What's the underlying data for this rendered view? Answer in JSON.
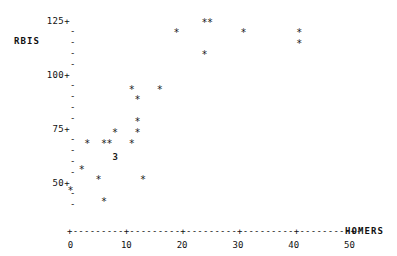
{
  "header": {
    "clipped_row": "THE    TOP   RBIS    AND   HOMERS"
  },
  "axes": {
    "ylabel": "RBIS",
    "xlabel": "HOMERS",
    "y_ticks": [
      "125+",
      "100+",
      "75+",
      "50+"
    ],
    "y_tick_values": [
      125,
      100,
      75,
      50
    ],
    "x_ticks": [
      "0",
      "10",
      "20",
      "30",
      "40",
      "50"
    ],
    "x_tick_values": [
      0,
      10,
      20,
      30,
      40,
      50
    ],
    "x_axis_glyph": "+---------+---------+---------+---------+---------+-",
    "minor_tick_glyph": "-",
    "marker_glyph": "*"
  },
  "chart_data": {
    "type": "scatter",
    "title": "",
    "xlabel": "HOMERS",
    "ylabel": "RBIS",
    "xlim": [
      0,
      52
    ],
    "ylim": [
      38,
      128
    ],
    "grid": false,
    "legend": null,
    "marker": "*",
    "note": "Character-cell scatter plot; the digit '3' marks a cell containing 3 coincident points.",
    "points": [
      {
        "x": 24,
        "y": 124,
        "label": "*"
      },
      {
        "x": 25,
        "y": 124,
        "label": "*"
      },
      {
        "x": 19,
        "y": 119,
        "label": "*"
      },
      {
        "x": 31,
        "y": 119,
        "label": "*"
      },
      {
        "x": 41,
        "y": 119,
        "label": "*"
      },
      {
        "x": 41,
        "y": 114,
        "label": "*"
      },
      {
        "x": 24,
        "y": 109,
        "label": "*"
      },
      {
        "x": 11,
        "y": 93,
        "label": "*"
      },
      {
        "x": 16,
        "y": 93,
        "label": "*"
      },
      {
        "x": 12,
        "y": 88,
        "label": "*"
      },
      {
        "x": 12,
        "y": 78,
        "label": "*"
      },
      {
        "x": 8,
        "y": 73,
        "label": "*"
      },
      {
        "x": 12,
        "y": 73,
        "label": "*"
      },
      {
        "x": 3,
        "y": 68,
        "label": "*"
      },
      {
        "x": 6,
        "y": 68,
        "label": "*"
      },
      {
        "x": 7,
        "y": 68,
        "label": "*"
      },
      {
        "x": 11,
        "y": 68,
        "label": "*"
      },
      {
        "x": 2,
        "y": 56,
        "label": "*"
      },
      {
        "x": 5,
        "y": 51,
        "label": "*"
      },
      {
        "x": 13,
        "y": 51,
        "label": "*"
      },
      {
        "x": 0,
        "y": 46,
        "label": "*"
      },
      {
        "x": 6,
        "y": 41,
        "label": "*"
      }
    ],
    "overplot_counts": [
      {
        "x": 8,
        "y": 62,
        "count": 3,
        "label": "3"
      }
    ]
  }
}
